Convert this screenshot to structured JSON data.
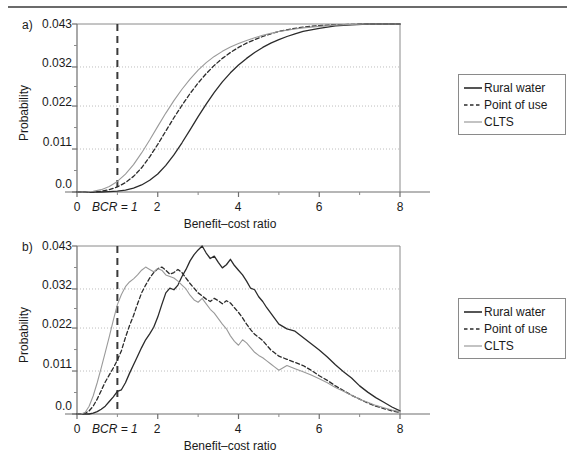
{
  "figure": {
    "panels": [
      {
        "letter": "a)",
        "ylabel": "Probability",
        "xlabel": "Benefit–cost ratio",
        "yticks": [
          "0.0",
          "0.011",
          "0.022",
          "0.032",
          "0.043"
        ],
        "xticks": [
          "0",
          "2",
          "4",
          "6",
          "8"
        ],
        "bcr_line_label": "BCR = 1"
      },
      {
        "letter": "b)",
        "ylabel": "Probability",
        "xlabel": "Benefit–cost ratio",
        "yticks": [
          "0.0",
          "0.011",
          "0.022",
          "0.032",
          "0.043"
        ],
        "xticks": [
          "0",
          "2",
          "4",
          "6",
          "8"
        ],
        "bcr_line_label": "BCR = 1"
      }
    ],
    "legend": {
      "entries": [
        {
          "label": "Rural water",
          "style": "solid",
          "color": "#2b2b2b"
        },
        {
          "label": "Point of use",
          "style": "dashed",
          "color": "#2b2b2b"
        },
        {
          "label": "CLTS",
          "style": "solid",
          "color": "#9a9a9a"
        }
      ]
    }
  },
  "chart_data": [
    {
      "type": "line",
      "title": "",
      "panel": "a)",
      "subtitle": "Cumulative probability distribution of benefit–cost ratios",
      "xlabel": "Benefit–cost ratio",
      "ylabel": "Probability",
      "xlim": [
        0,
        8
      ],
      "ylim": [
        0.0,
        0.043
      ],
      "yticks": [
        0.0,
        0.011,
        0.022,
        0.032,
        0.043
      ],
      "xticks": [
        0,
        2,
        4,
        6,
        8
      ],
      "grid": "horizontal-dotted",
      "legend_position": "right",
      "annotations": [
        {
          "type": "vline",
          "x": 1,
          "label": "BCR = 1",
          "style": "dashed",
          "color": "#3a3a3a"
        }
      ],
      "x": [
        0.0,
        0.2,
        0.4,
        0.6,
        0.8,
        1.0,
        1.2,
        1.4,
        1.6,
        1.8,
        2.0,
        2.2,
        2.4,
        2.6,
        2.8,
        3.0,
        3.2,
        3.4,
        3.6,
        3.8,
        4.0,
        4.2,
        4.4,
        4.6,
        4.8,
        5.0,
        5.2,
        5.4,
        5.6,
        5.8,
        6.0,
        6.4,
        6.8,
        7.2,
        7.6,
        8.0
      ],
      "series": [
        {
          "name": "Rural water",
          "style": "solid",
          "color": "#2b2b2b",
          "values": [
            0.0,
            0.0,
            0.0,
            0.0,
            0.0001,
            0.0002,
            0.0005,
            0.001,
            0.0018,
            0.003,
            0.0046,
            0.0068,
            0.0095,
            0.0126,
            0.0159,
            0.0193,
            0.0225,
            0.0255,
            0.0282,
            0.0305,
            0.0325,
            0.0342,
            0.0357,
            0.037,
            0.0381,
            0.039,
            0.0398,
            0.0405,
            0.0411,
            0.0415,
            0.0419,
            0.0425,
            0.0428,
            0.043,
            0.043,
            0.043
          ]
        },
        {
          "name": "Point of use",
          "style": "dashed",
          "color": "#2b2b2b",
          "values": [
            0.0,
            0.0,
            0.0,
            0.0002,
            0.0006,
            0.0013,
            0.0024,
            0.004,
            0.0062,
            0.009,
            0.0122,
            0.0156,
            0.019,
            0.0222,
            0.0252,
            0.0279,
            0.0303,
            0.0324,
            0.0342,
            0.0357,
            0.037,
            0.0381,
            0.039,
            0.0398,
            0.0405,
            0.0411,
            0.0415,
            0.0419,
            0.0422,
            0.0424,
            0.0426,
            0.0428,
            0.0429,
            0.043,
            0.043,
            0.043
          ]
        },
        {
          "name": "CLTS",
          "style": "solid",
          "color": "#9a9a9a",
          "values": [
            0.0,
            0.0,
            0.0002,
            0.0006,
            0.0014,
            0.0027,
            0.0046,
            0.007,
            0.01,
            0.0133,
            0.0168,
            0.0202,
            0.0234,
            0.0263,
            0.0289,
            0.0312,
            0.0331,
            0.0347,
            0.036,
            0.0371,
            0.038,
            0.0388,
            0.0395,
            0.0401,
            0.0406,
            0.0411,
            0.0414,
            0.0417,
            0.042,
            0.0422,
            0.0424,
            0.0427,
            0.0429,
            0.043,
            0.043,
            0.043
          ]
        }
      ]
    },
    {
      "type": "line",
      "title": "",
      "panel": "b)",
      "subtitle": "Probability density of benefit–cost ratios",
      "xlabel": "Benefit–cost ratio",
      "ylabel": "Probability",
      "xlim": [
        0,
        8
      ],
      "ylim": [
        0.0,
        0.043
      ],
      "yticks": [
        0.0,
        0.011,
        0.022,
        0.032,
        0.043
      ],
      "xticks": [
        0,
        2,
        4,
        6,
        8
      ],
      "grid": "horizontal-dotted",
      "legend_position": "right",
      "annotations": [
        {
          "type": "vline",
          "x": 1,
          "label": "BCR = 1",
          "style": "dashed",
          "color": "#3a3a3a"
        }
      ],
      "x": [
        0.0,
        0.1,
        0.2,
        0.3,
        0.4,
        0.5,
        0.6,
        0.7,
        0.8,
        0.9,
        1.0,
        1.1,
        1.2,
        1.3,
        1.4,
        1.5,
        1.6,
        1.7,
        1.8,
        1.9,
        2.0,
        2.1,
        2.2,
        2.3,
        2.4,
        2.5,
        2.6,
        2.7,
        2.8,
        2.9,
        3.0,
        3.1,
        3.2,
        3.3,
        3.4,
        3.5,
        3.6,
        3.7,
        3.8,
        3.9,
        4.0,
        4.1,
        4.2,
        4.3,
        4.4,
        4.5,
        4.6,
        4.7,
        4.8,
        4.9,
        5.0,
        5.2,
        5.4,
        5.6,
        5.8,
        6.0,
        6.2,
        6.4,
        6.6,
        6.8,
        7.0,
        7.2,
        7.4,
        7.6,
        7.8,
        8.0
      ],
      "series": [
        {
          "name": "Rural water",
          "style": "solid",
          "color": "#2b2b2b",
          "values": [
            0.0,
            0.0,
            0.0,
            0.0,
            0.0002,
            0.0006,
            0.0012,
            0.002,
            0.0032,
            0.0044,
            0.0058,
            0.0062,
            0.008,
            0.0104,
            0.0126,
            0.0148,
            0.017,
            0.019,
            0.0205,
            0.0222,
            0.0248,
            0.028,
            0.031,
            0.0322,
            0.0318,
            0.033,
            0.0352,
            0.037,
            0.0392,
            0.0408,
            0.042,
            0.043,
            0.0412,
            0.0398,
            0.0404,
            0.0388,
            0.0374,
            0.0382,
            0.0396,
            0.038,
            0.0368,
            0.0356,
            0.034,
            0.0322,
            0.0318,
            0.03,
            0.0288,
            0.0272,
            0.0258,
            0.0244,
            0.023,
            0.0218,
            0.0212,
            0.0196,
            0.018,
            0.0164,
            0.0146,
            0.0126,
            0.0108,
            0.0092,
            0.0072,
            0.0056,
            0.0042,
            0.003,
            0.0018,
            0.0008
          ]
        },
        {
          "name": "Point of use",
          "style": "dashed",
          "color": "#2b2b2b",
          "values": [
            0.0,
            0.0,
            0.0002,
            0.0008,
            0.002,
            0.0038,
            0.006,
            0.0082,
            0.01,
            0.0118,
            0.0138,
            0.0162,
            0.0196,
            0.0226,
            0.0252,
            0.0282,
            0.031,
            0.033,
            0.0348,
            0.0362,
            0.0372,
            0.0376,
            0.0368,
            0.0358,
            0.0362,
            0.037,
            0.0362,
            0.0348,
            0.0334,
            0.0322,
            0.031,
            0.0302,
            0.0294,
            0.0288,
            0.0296,
            0.029,
            0.0282,
            0.029,
            0.0284,
            0.0272,
            0.026,
            0.0246,
            0.023,
            0.0216,
            0.0204,
            0.0196,
            0.0188,
            0.0176,
            0.0164,
            0.0156,
            0.0148,
            0.014,
            0.0132,
            0.0124,
            0.0112,
            0.0098,
            0.0086,
            0.0072,
            0.006,
            0.0048,
            0.0038,
            0.0028,
            0.002,
            0.0014,
            0.0008,
            0.0004
          ]
        },
        {
          "name": "CLTS",
          "style": "solid",
          "color": "#9a9a9a",
          "values": [
            0.0,
            0.0,
            0.0004,
            0.002,
            0.0046,
            0.008,
            0.0118,
            0.0158,
            0.0198,
            0.024,
            0.028,
            0.0306,
            0.0326,
            0.0338,
            0.0346,
            0.0356,
            0.0368,
            0.0376,
            0.037,
            0.0364,
            0.0372,
            0.0368,
            0.0356,
            0.0352,
            0.0348,
            0.034,
            0.033,
            0.032,
            0.0304,
            0.0292,
            0.0286,
            0.0296,
            0.0282,
            0.0268,
            0.0258,
            0.0244,
            0.023,
            0.0218,
            0.02,
            0.0186,
            0.0176,
            0.019,
            0.0182,
            0.017,
            0.0158,
            0.015,
            0.0144,
            0.0136,
            0.0128,
            0.012,
            0.0112,
            0.0124,
            0.0116,
            0.0108,
            0.01,
            0.009,
            0.008,
            0.0068,
            0.0058,
            0.0048,
            0.0038,
            0.003,
            0.0022,
            0.0016,
            0.001,
            0.0006
          ]
        }
      ]
    }
  ]
}
